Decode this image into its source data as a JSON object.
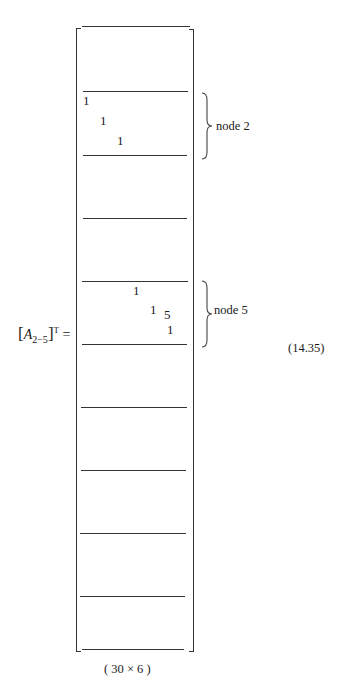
{
  "equation": {
    "lhs_base": "A",
    "lhs_subscript": "2−5",
    "lhs_superscript": "T",
    "equals": "=",
    "number": "(14.35)",
    "dimensions": "( 30 × 6 )"
  },
  "braces": [
    {
      "label": "node 2"
    },
    {
      "label": "node 5"
    }
  ],
  "entries": {
    "node2": [
      "1",
      "1",
      "1"
    ],
    "node5": [
      "1",
      "1",
      "5",
      "1"
    ]
  }
}
